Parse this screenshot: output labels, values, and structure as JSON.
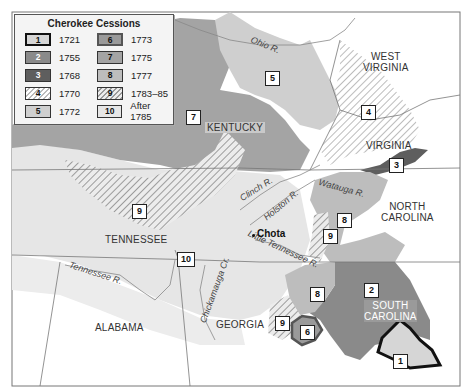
{
  "legend": {
    "title": "Cherokee Cessions",
    "items": [
      {
        "num": "1",
        "year": "1721"
      },
      {
        "num": "2",
        "year": "1755"
      },
      {
        "num": "3",
        "year": "1768"
      },
      {
        "num": "4",
        "year": "1770"
      },
      {
        "num": "5",
        "year": "1772"
      },
      {
        "num": "6",
        "year": "1773"
      },
      {
        "num": "7",
        "year": "1775"
      },
      {
        "num": "8",
        "year": "1777"
      },
      {
        "num": "9",
        "year": "1783–85"
      },
      {
        "num": "10",
        "year": "After 1785"
      }
    ]
  },
  "states": {
    "west_virginia": "WEST\nVIRGINIA",
    "kentucky": "KENTUCKY",
    "virginia": "VIRGINIA",
    "north_carolina": "NORTH\nCAROLINA",
    "tennessee": "TENNESSEE",
    "south_carolina": "SOUTH\nCAROLINA",
    "georgia": "GEORGIA",
    "alabama": "ALABAMA"
  },
  "rivers": {
    "ohio": "Ohio R.",
    "clinch": "Clinch R.",
    "holston": "Holston R.",
    "watauga": "Watauga R.",
    "little_tennessee": "Little Tennessee R.",
    "tennessee": "Tennessee R.",
    "chickamauga": "Chickamauga Cr."
  },
  "places": {
    "chota": "Chota"
  },
  "map_markers": [
    {
      "num": "5",
      "x": 265,
      "y": 71
    },
    {
      "num": "7",
      "x": 186,
      "y": 110
    },
    {
      "num": "4",
      "x": 361,
      "y": 105
    },
    {
      "num": "3",
      "x": 389,
      "y": 158
    },
    {
      "num": "8",
      "x": 337,
      "y": 213
    },
    {
      "num": "9",
      "x": 323,
      "y": 229
    },
    {
      "num": "9",
      "x": 132,
      "y": 204
    },
    {
      "num": "10",
      "x": 177,
      "y": 252
    },
    {
      "num": "2",
      "x": 364,
      "y": 283
    },
    {
      "num": "8",
      "x": 310,
      "y": 287
    },
    {
      "num": "9",
      "x": 275,
      "y": 316
    },
    {
      "num": "6",
      "x": 300,
      "y": 325
    },
    {
      "num": "1",
      "x": 393,
      "y": 354
    }
  ],
  "colors": {
    "background": "#ffffff",
    "land_shade": "#e9e9e9",
    "cession_1": "#d6d6d6",
    "cession_2": "#8a8a8a",
    "cession_3": "#5e5e5e",
    "cession_5": "#cfcfcf",
    "cession_7": "#a4a4a4",
    "cession_8": "#bdbdbd"
  }
}
